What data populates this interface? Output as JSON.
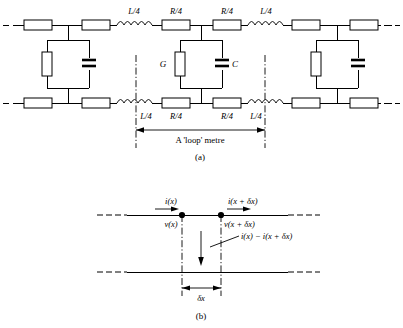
{
  "figure": {
    "panels": [
      {
        "id": "a",
        "caption": "(a)",
        "span_label": "A 'loop' metre",
        "series_labels_top": [
          "L/4",
          "R/4",
          "R/4",
          "L/4"
        ],
        "series_labels_bottom": [
          "L/4",
          "R/4",
          "R/4",
          "L/4"
        ],
        "shunt_conductance_label": "G",
        "shunt_capacitance_label": "C"
      },
      {
        "id": "b",
        "caption": "(b)",
        "current_in_label": "i(x)",
        "voltage_in_label": "v(x)",
        "current_out_label": "i(x + δx)",
        "voltage_out_label": "v(x + δx)",
        "shunt_current_label": "i(x) − i(x + δx)",
        "span_label": "δx"
      }
    ],
    "colors": {
      "line": "#000000",
      "background": "#ffffff",
      "fill": "#ffffff"
    }
  }
}
